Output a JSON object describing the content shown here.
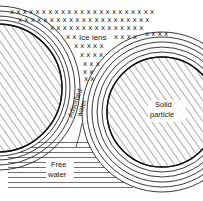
{
  "diagram": {
    "labels": {
      "ice_lens": "Ice lens",
      "adsorbed_water_line1": "Adsorbed",
      "adsorbed_water_line2": "water",
      "solid_particle_line1": "Solid",
      "solid_particle_line2": "particle",
      "free_water_line1": "Free",
      "free_water_line2": "water"
    },
    "elements": [
      {
        "name": "ice-lens",
        "pattern": "x-marks",
        "region": "top"
      },
      {
        "name": "left-solid-particle",
        "pattern": "diagonal-hatch",
        "region": "left"
      },
      {
        "name": "right-solid-particle",
        "pattern": "diagonal-hatch",
        "region": "right"
      },
      {
        "name": "adsorbed-water-films",
        "pattern": "concentric-rings",
        "region": "around particles"
      },
      {
        "name": "free-water",
        "pattern": "horizontal-lines",
        "region": "bottom-left"
      }
    ],
    "colors": {
      "ink": "#1a1a1a",
      "background": "#ffffff"
    }
  }
}
